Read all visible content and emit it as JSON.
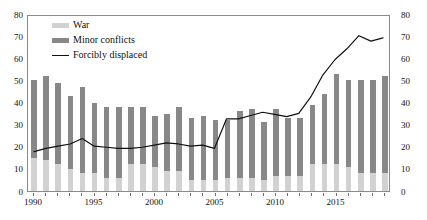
{
  "chart_data": {
    "type": "bar",
    "title": "",
    "subtitle": "",
    "xlabel": "",
    "ylabel": "",
    "ylim": [
      0,
      80
    ],
    "y2lim": [
      0,
      80
    ],
    "yticks": [
      0,
      10,
      20,
      30,
      40,
      50,
      60,
      70,
      80
    ],
    "y2ticks": [
      0,
      10,
      20,
      30,
      40,
      50,
      60,
      70,
      80
    ],
    "grid": false,
    "legend_position": "top-left",
    "stacked": true,
    "x": [
      1990,
      1991,
      1992,
      1993,
      1994,
      1995,
      1996,
      1997,
      1998,
      1999,
      2000,
      2001,
      2002,
      2003,
      2004,
      2005,
      2006,
      2007,
      2008,
      2009,
      2010,
      2011,
      2012,
      2013,
      2014,
      2015,
      2016,
      2017,
      2018,
      2019
    ],
    "categories": [
      "1990",
      "1991",
      "1992",
      "1993",
      "1994",
      "1995",
      "1996",
      "1997",
      "1998",
      "1999",
      "2000",
      "2001",
      "2002",
      "2003",
      "2004",
      "2005",
      "2006",
      "2007",
      "2008",
      "2009",
      "2010",
      "2011",
      "2012",
      "2013",
      "2014",
      "2015",
      "2016",
      "2017",
      "2018",
      "2019"
    ],
    "xtick_labels": [
      "1990",
      "1995",
      "2000",
      "2005",
      "2010",
      "2015"
    ],
    "xtick_values": [
      1990,
      1995,
      2000,
      2005,
      2010,
      2015
    ],
    "series": [
      {
        "name": "War",
        "type": "bar",
        "color": "#d2d2d2",
        "axis": "left",
        "values": [
          15,
          14,
          12,
          10,
          8,
          8,
          6,
          6,
          12,
          12,
          11,
          9,
          9,
          5,
          5,
          5,
          6,
          6,
          6,
          5,
          7,
          7,
          7,
          12,
          12,
          12,
          11,
          8,
          8,
          8
        ]
      },
      {
        "name": "Minor conflicts",
        "type": "bar",
        "color": "#888888",
        "axis": "left",
        "values": [
          35,
          38,
          37,
          33,
          39,
          32,
          32,
          32,
          26,
          26,
          23,
          26,
          29,
          28,
          29,
          27,
          26,
          30,
          31,
          26,
          30,
          26,
          26,
          27,
          32,
          41,
          39,
          42,
          42,
          44
        ]
      },
      {
        "name": "Forcibly displaced",
        "type": "line",
        "color": "#111111",
        "axis": "right",
        "values": [
          18,
          19.5,
          20.5,
          21.5,
          24,
          20.5,
          20,
          19.5,
          19.5,
          20,
          21,
          22,
          21.5,
          20.5,
          21,
          19.5,
          33,
          33,
          34.5,
          36,
          35,
          34,
          35.5,
          43,
          53,
          60,
          65,
          71,
          68.5,
          70
        ]
      }
    ],
    "legend_entries": [
      {
        "label": "War",
        "marker": "swatch",
        "color": "#d2d2d2"
      },
      {
        "label": "Minor conflicts",
        "marker": "swatch",
        "color": "#888888"
      },
      {
        "label": "Forcibly displaced",
        "marker": "line",
        "color": "#111111"
      }
    ]
  }
}
